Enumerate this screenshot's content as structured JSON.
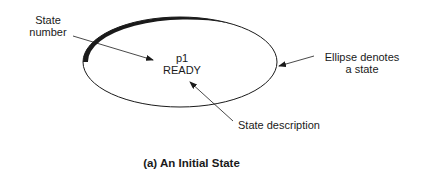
{
  "diagram": {
    "title": "(a) An Initial State",
    "state": {
      "number": "p1",
      "description": "READY",
      "shape": "ellipse"
    },
    "annotations": {
      "state_number": [
        "State",
        "number"
      ],
      "ellipse": [
        "Ellipse denotes",
        "a state"
      ],
      "state_description": "State description"
    },
    "colors": {
      "stroke": "#1a1a1a",
      "background": "#ffffff"
    }
  }
}
